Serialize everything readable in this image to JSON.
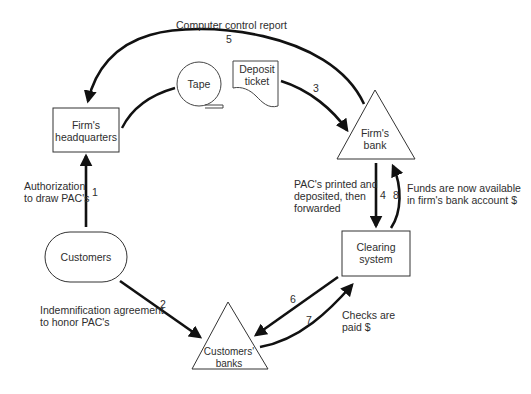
{
  "nodes": {
    "headquarters": {
      "line1": "Firm's",
      "line2": "headquarters"
    },
    "tape": {
      "label": "Tape"
    },
    "deposit_ticket": {
      "line1": "Deposit",
      "line2": "ticket"
    },
    "firms_bank": {
      "line1": "Firm's",
      "line2": "bank"
    },
    "customers": {
      "label": "Customers"
    },
    "clearing_system": {
      "line1": "Clearing",
      "line2": "system"
    },
    "customers_banks": {
      "line1": "Customers'",
      "line2": "banks"
    }
  },
  "flows": {
    "f1": {
      "number": "1",
      "line1": "Authorization",
      "line2": "to draw PAC's"
    },
    "f2": {
      "number": "2",
      "line1": "Indemnification agreement",
      "line2": "to honor PAC's"
    },
    "f3": {
      "number": "3"
    },
    "f4": {
      "number": "4",
      "line1": "PAC's printed and",
      "line2": "deposited, then",
      "line3": "forwarded"
    },
    "f5": {
      "number": "5",
      "label": "Computer control report"
    },
    "f6": {
      "number": "6"
    },
    "f7": {
      "number": "7",
      "line1": "Checks are",
      "line2": "paid $"
    },
    "f8": {
      "number": "8",
      "line1": "Funds are now available",
      "line2": "in firm's bank account $"
    }
  },
  "colors": {
    "stroke": "#1a1a1a",
    "text": "#2e2e2e",
    "background": "#ffffff"
  }
}
